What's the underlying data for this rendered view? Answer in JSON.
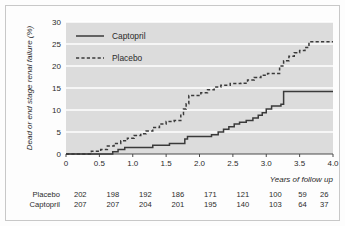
{
  "chart_data": {
    "type": "line",
    "title": "",
    "xlabel": "Years of follow up",
    "ylabel": "Dead or end stage renal failure (%)",
    "xlim": [
      0,
      4.0
    ],
    "ylim": [
      0,
      30
    ],
    "xticks": [
      "0",
      "0.5",
      "1.0",
      "1.5",
      "2.0",
      "2.5",
      "3.0",
      "3.5",
      "4.0"
    ],
    "xtick_values": [
      0,
      0.5,
      1.0,
      1.5,
      2.0,
      2.5,
      3.0,
      3.5,
      4.0
    ],
    "yticks": [
      "0",
      "5",
      "10",
      "15",
      "20",
      "25",
      "30"
    ],
    "ytick_values": [
      0,
      5,
      10,
      15,
      20,
      25,
      30
    ],
    "grid": "horizontal-white-gridlines",
    "plot_background": "#dcdcdc",
    "legend_position": "top-left-inside",
    "series": [
      {
        "name": "Captopril",
        "style": "solid",
        "color": "#3a3a3a",
        "points": [
          [
            0.0,
            0.0
          ],
          [
            0.7,
            0.0
          ],
          [
            0.7,
            0.5
          ],
          [
            0.78,
            0.5
          ],
          [
            0.78,
            1.0
          ],
          [
            0.88,
            1.0
          ],
          [
            0.88,
            1.5
          ],
          [
            1.3,
            1.5
          ],
          [
            1.3,
            2.0
          ],
          [
            1.55,
            2.0
          ],
          [
            1.55,
            2.4
          ],
          [
            1.78,
            2.4
          ],
          [
            1.78,
            3.4
          ],
          [
            1.82,
            3.4
          ],
          [
            1.82,
            4.0
          ],
          [
            2.18,
            4.0
          ],
          [
            2.18,
            4.4
          ],
          [
            2.28,
            4.4
          ],
          [
            2.28,
            5.0
          ],
          [
            2.36,
            5.0
          ],
          [
            2.36,
            5.6
          ],
          [
            2.44,
            5.6
          ],
          [
            2.44,
            6.2
          ],
          [
            2.52,
            6.2
          ],
          [
            2.52,
            6.8
          ],
          [
            2.6,
            6.8
          ],
          [
            2.6,
            7.2
          ],
          [
            2.7,
            7.2
          ],
          [
            2.7,
            7.6
          ],
          [
            2.8,
            7.6
          ],
          [
            2.8,
            8.2
          ],
          [
            2.88,
            8.2
          ],
          [
            2.88,
            8.8
          ],
          [
            2.94,
            8.8
          ],
          [
            2.94,
            9.4
          ],
          [
            3.0,
            9.4
          ],
          [
            3.0,
            10.2
          ],
          [
            3.08,
            10.2
          ],
          [
            3.08,
            10.9
          ],
          [
            3.22,
            10.9
          ],
          [
            3.22,
            11.3
          ],
          [
            3.26,
            11.3
          ],
          [
            3.26,
            14.2
          ],
          [
            4.0,
            14.2
          ]
        ]
      },
      {
        "name": "Placebo",
        "style": "dashed",
        "color": "#3a3a3a",
        "points": [
          [
            0.0,
            0.0
          ],
          [
            0.38,
            0.0
          ],
          [
            0.38,
            0.6
          ],
          [
            0.52,
            0.6
          ],
          [
            0.52,
            1.0
          ],
          [
            0.62,
            1.0
          ],
          [
            0.62,
            1.8
          ],
          [
            0.72,
            1.8
          ],
          [
            0.72,
            2.4
          ],
          [
            0.82,
            2.4
          ],
          [
            0.82,
            3.0
          ],
          [
            0.92,
            3.0
          ],
          [
            0.92,
            3.6
          ],
          [
            1.02,
            3.6
          ],
          [
            1.02,
            4.2
          ],
          [
            1.12,
            4.2
          ],
          [
            1.12,
            4.6
          ],
          [
            1.2,
            4.6
          ],
          [
            1.2,
            5.2
          ],
          [
            1.3,
            5.2
          ],
          [
            1.3,
            6.0
          ],
          [
            1.4,
            6.0
          ],
          [
            1.4,
            6.8
          ],
          [
            1.5,
            6.8
          ],
          [
            1.5,
            7.4
          ],
          [
            1.62,
            7.4
          ],
          [
            1.62,
            7.6
          ],
          [
            1.72,
            7.6
          ],
          [
            1.72,
            9.0
          ],
          [
            1.76,
            9.0
          ],
          [
            1.76,
            10.2
          ],
          [
            1.8,
            10.2
          ],
          [
            1.8,
            11.4
          ],
          [
            1.84,
            11.4
          ],
          [
            1.84,
            13.3
          ],
          [
            2.02,
            13.3
          ],
          [
            2.02,
            13.9
          ],
          [
            2.12,
            13.9
          ],
          [
            2.12,
            14.6
          ],
          [
            2.22,
            14.6
          ],
          [
            2.22,
            15.2
          ],
          [
            2.32,
            15.2
          ],
          [
            2.32,
            15.6
          ],
          [
            2.46,
            15.6
          ],
          [
            2.46,
            16.0
          ],
          [
            2.62,
            16.0
          ],
          [
            2.62,
            16.1
          ],
          [
            2.72,
            16.1
          ],
          [
            2.72,
            16.8
          ],
          [
            2.82,
            16.8
          ],
          [
            2.82,
            17.4
          ],
          [
            2.92,
            17.4
          ],
          [
            2.92,
            17.9
          ],
          [
            3.02,
            17.9
          ],
          [
            3.02,
            18.3
          ],
          [
            3.2,
            18.3
          ],
          [
            3.2,
            20.0
          ],
          [
            3.26,
            20.0
          ],
          [
            3.26,
            21.2
          ],
          [
            3.34,
            21.2
          ],
          [
            3.34,
            22.2
          ],
          [
            3.42,
            22.2
          ],
          [
            3.42,
            23.0
          ],
          [
            3.5,
            23.0
          ],
          [
            3.5,
            23.5
          ],
          [
            3.58,
            23.5
          ],
          [
            3.58,
            24.2
          ],
          [
            3.64,
            24.2
          ],
          [
            3.64,
            25.5
          ],
          [
            4.0,
            25.5
          ]
        ]
      }
    ]
  },
  "legend": {
    "items": [
      {
        "label": "Captopril",
        "style": "solid"
      },
      {
        "label": "Placebo",
        "style": "dashed"
      }
    ]
  },
  "risk_table": {
    "rows": [
      {
        "label": "Placebo",
        "values": [
          "202",
          "198",
          "192",
          "186",
          "171",
          "121",
          "100",
          "59",
          "26"
        ]
      },
      {
        "label": "Captopril",
        "values": [
          "207",
          "207",
          "204",
          "201",
          "195",
          "140",
          "103",
          "64",
          "37"
        ]
      }
    ]
  }
}
